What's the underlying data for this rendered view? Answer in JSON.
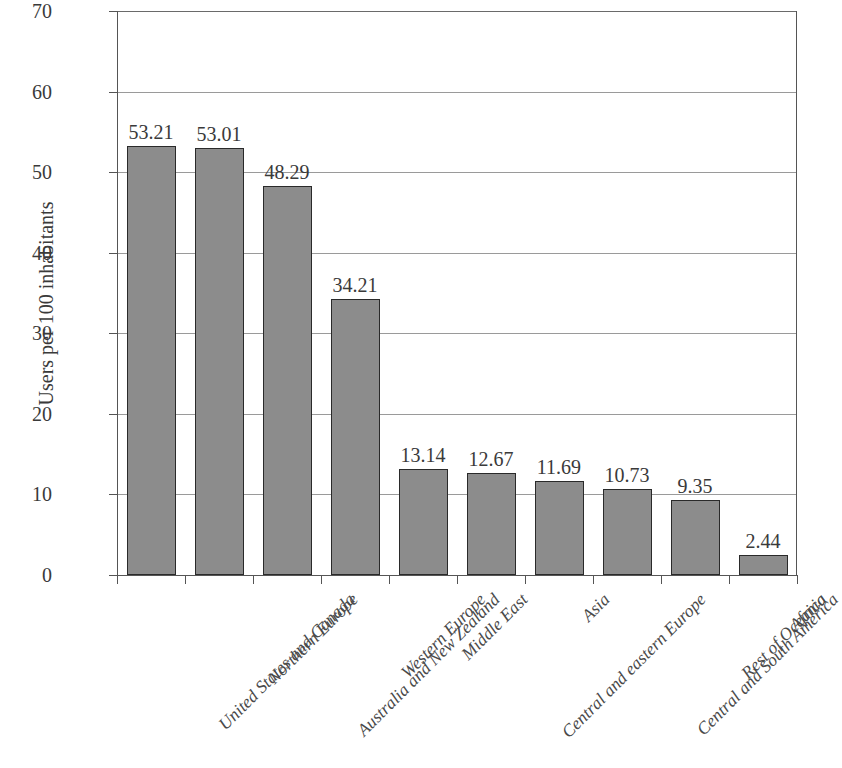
{
  "chart_data": {
    "type": "bar",
    "title": "",
    "subtitle": "",
    "xlabel": "",
    "ylabel": "Users per 100 inhabitants",
    "ylim": [
      0,
      70
    ],
    "ytick_values": [
      0,
      10,
      20,
      30,
      40,
      50,
      60,
      70
    ],
    "ytick_labels": [
      "0",
      "10",
      "20",
      "30",
      "40",
      "50",
      "60",
      "70"
    ],
    "grid": true,
    "legend": "none",
    "bar_color": "#8c8c8c",
    "bar_edge_color": "#2a2a2a",
    "value_label_precision": 2,
    "categories": [
      "United States and Canada",
      "Northern Europe",
      "Australia and New Zealand",
      "Western Europe",
      "Middle East",
      "Central and eastern Europe",
      "Asia",
      "Central and South America",
      "Rest of Oceania",
      "Africa"
    ],
    "values": [
      53.21,
      53.01,
      48.29,
      34.21,
      13.14,
      12.67,
      11.69,
      10.73,
      9.35,
      2.44
    ],
    "value_labels": [
      "53.21",
      "53.01",
      "48.29",
      "34.21",
      "13.14",
      "12.67",
      "11.69",
      "10.73",
      "9.35",
      "2.44"
    ]
  }
}
